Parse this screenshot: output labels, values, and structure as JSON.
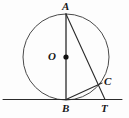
{
  "figure": {
    "canvas": {
      "width": 129,
      "height": 118,
      "background": "#fdfdfd"
    },
    "colors": {
      "stroke": "#2b2b2b",
      "circle_stroke": "#4a4a4a",
      "label": "#171717",
      "dot": "#111111"
    },
    "circle": {
      "cx": 66,
      "cy": 57,
      "r": 43,
      "stroke_width": 1
    },
    "center_dot": {
      "cx": 66,
      "cy": 57,
      "r": 2.6
    },
    "points": {
      "A": {
        "x": 66,
        "y": 14
      },
      "B": {
        "x": 66,
        "y": 99.5
      },
      "C": {
        "x": 102,
        "y": 83
      },
      "O": {
        "x": 66,
        "y": 57
      },
      "T": {
        "x": 105,
        "y": 99.5
      }
    },
    "segments": [
      {
        "name": "diameter-AB",
        "x1": 66,
        "y1": 14,
        "x2": 66,
        "y2": 99.5,
        "width": 1.3
      },
      {
        "name": "secant-A-to-T",
        "x1": 66,
        "y1": 14,
        "x2": 105,
        "y2": 99.5,
        "width": 1.1
      },
      {
        "name": "chord-BC",
        "x1": 66,
        "y1": 99.5,
        "x2": 102,
        "y2": 83,
        "width": 1.1
      }
    ],
    "tangent_line": {
      "name": "tangent-at-B",
      "x1": 3,
      "y1": 99.5,
      "x2": 122,
      "y2": 99.5,
      "width": 1
    },
    "labels": [
      {
        "id": "A",
        "text": "A",
        "left": 62,
        "top": 1,
        "name": "label-point-a"
      },
      {
        "id": "O",
        "text": "O",
        "left": 48,
        "top": 51,
        "name": "label-center-o"
      },
      {
        "id": "C",
        "text": "C",
        "left": 104,
        "top": 76,
        "name": "label-point-c"
      },
      {
        "id": "B",
        "text": "B",
        "left": 62,
        "top": 103,
        "name": "label-point-b"
      },
      {
        "id": "T",
        "text": "T",
        "left": 101,
        "top": 103,
        "name": "label-point-t"
      }
    ]
  }
}
